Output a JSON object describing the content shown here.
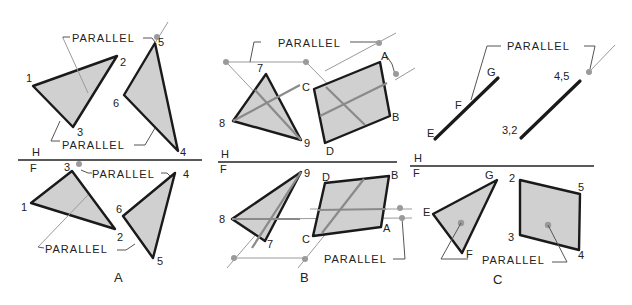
{
  "figure": {
    "panels": [
      {
        "caption": "A",
        "top_view": {
          "fold_labels": {
            "top": "H"
          },
          "vertices": [
            "1",
            "2",
            "3",
            "5",
            "6",
            "4"
          ],
          "annotations": [
            "PARALLEL",
            "PARALLEL"
          ]
        },
        "front_view": {
          "fold_labels": {
            "top": "H",
            "bottom": "F"
          },
          "vertices": [
            "3",
            "1",
            "2",
            "4",
            "6",
            "5"
          ],
          "annotations": [
            "PARALLEL",
            "PARALLEL"
          ]
        }
      },
      {
        "caption": "B",
        "top_view": {
          "fold_labels": {
            "top": "H"
          },
          "vertices": [
            "7",
            "8",
            "9",
            "C",
            "A",
            "B",
            "D"
          ],
          "annotations": [
            "PARALLEL"
          ]
        },
        "front_view": {
          "fold_labels": {
            "top": "H",
            "bottom": "F"
          },
          "vertices": [
            "9",
            "8",
            "7",
            "D",
            "B",
            "C",
            "A"
          ],
          "annotations": [
            "PARALLEL"
          ]
        }
      },
      {
        "caption": "C",
        "top_view": {
          "fold_labels": {
            "top": "H"
          },
          "vertices": [
            "G",
            "F",
            "E",
            "4,5",
            "3,2"
          ],
          "annotations": [
            "PARALLEL"
          ]
        },
        "front_view": {
          "fold_labels": {
            "top": "H",
            "bottom": "F"
          },
          "vertices": [
            "G",
            "E",
            "F",
            "2",
            "5",
            "3",
            "4"
          ],
          "annotations": [
            "PARALLEL"
          ]
        }
      }
    ]
  },
  "labels": {
    "parallel": "PARALLEL",
    "H": "H",
    "F": "F",
    "A": "A",
    "B": "B",
    "C": "C",
    "v1": "1",
    "v2": "2",
    "v3": "3",
    "v4": "4",
    "v5": "5",
    "v6": "6",
    "v7": "7",
    "v8": "8",
    "v9": "9",
    "vA": "A",
    "vB": "B",
    "vC": "C",
    "vD": "D",
    "vE": "E",
    "vF": "F",
    "vG": "G",
    "v45": "4,5",
    "v32": "3,2"
  },
  "colors": {
    "face_fill": "#d0d0d0",
    "edge": "#1a1a1a",
    "construction": "#9a9a9a"
  }
}
